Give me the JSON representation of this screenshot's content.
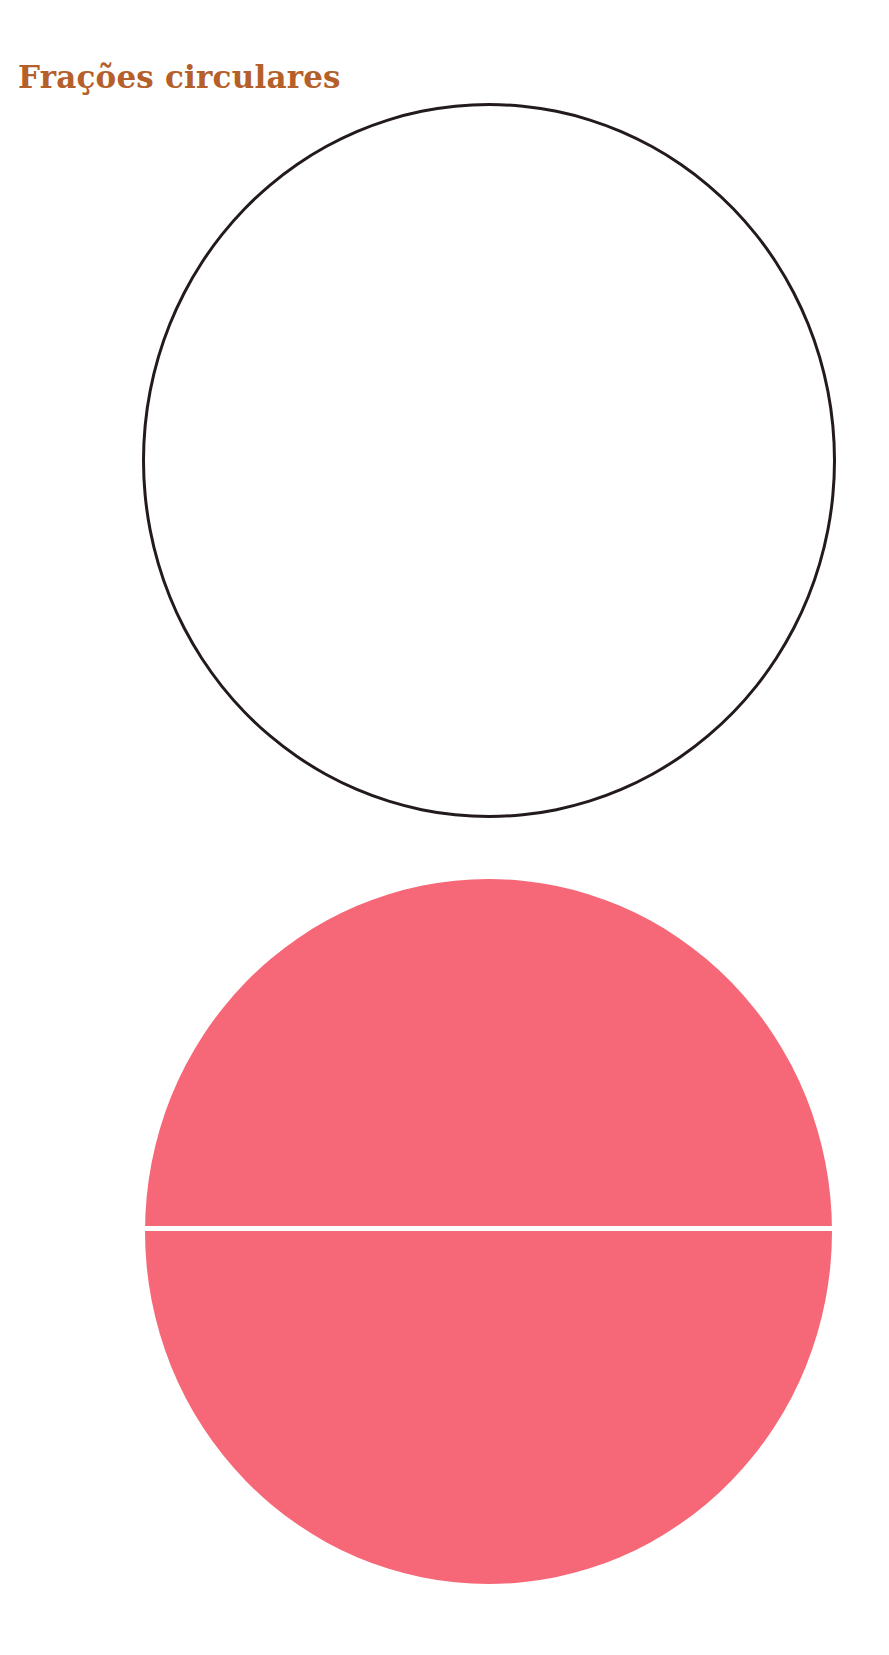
{
  "page": {
    "title": "Frações circulares",
    "title_color": "#B5602A"
  },
  "figures": [
    {
      "name": "whole-circle-outline",
      "type": "circle-outline",
      "stroke_color": "#231A1C",
      "parts": 1
    },
    {
      "name": "circle-halves",
      "type": "circle-filled",
      "fill_color": "#F66878",
      "divider_color": "#FFFFFF",
      "parts": 2,
      "division": "horizontal"
    }
  ]
}
